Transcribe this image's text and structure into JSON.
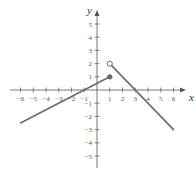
{
  "chart_data": {
    "type": "line",
    "title": "",
    "xlabel": "x",
    "ylabel": "y",
    "xlim": [
      -6.5,
      6.8
    ],
    "ylim": [
      -5.8,
      5.8
    ],
    "x_ticks": [
      -6,
      -5,
      -4,
      -3,
      -2,
      -1,
      1,
      2,
      3,
      4,
      5,
      6
    ],
    "y_ticks": [
      5,
      4,
      3,
      2,
      1,
      -1,
      -2,
      -3,
      -4,
      -5
    ],
    "grid": false,
    "series": [
      {
        "name": "left-piece",
        "points": [
          [
            -6,
            -2.5
          ],
          [
            1,
            1
          ]
        ],
        "end_marker": {
          "x": 1,
          "y": 1,
          "style": "filled"
        }
      },
      {
        "name": "right-piece",
        "points": [
          [
            1,
            2
          ],
          [
            6,
            -3
          ]
        ],
        "start_marker": {
          "x": 1,
          "y": 2,
          "style": "open"
        }
      }
    ],
    "colors": {
      "axis": "#555555",
      "line": "#6b6b6b",
      "marker": "#6b6b6b"
    }
  }
}
